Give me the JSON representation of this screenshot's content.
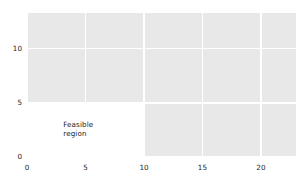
{
  "chart_data": {
    "type": "area",
    "title": "",
    "xlabel": "",
    "ylabel": "",
    "xlim": [
      0,
      23
    ],
    "ylim": [
      0,
      13.3
    ],
    "xticks": [
      0,
      5,
      10,
      15,
      20
    ],
    "xtick_labels": [
      "0",
      "5",
      "10",
      "15",
      "20"
    ],
    "yticks": [
      0,
      5,
      10
    ],
    "ytick_labels": [
      "0",
      "5",
      "10"
    ],
    "grid": true,
    "grid_color": "#ffffff",
    "plot_background": "#e8e8e8",
    "figure_background": "#ffffff",
    "legend": null,
    "regions": [
      {
        "name": "feasible-region",
        "label": "Feasible\nregion",
        "shape": "rectangle",
        "x_range": [
          0,
          10
        ],
        "y_range": [
          0,
          5
        ],
        "fill": "#ffffff",
        "label_x": 3.1,
        "label_y": 2.6,
        "label_color": "#1a1a1a"
      }
    ],
    "series": []
  }
}
